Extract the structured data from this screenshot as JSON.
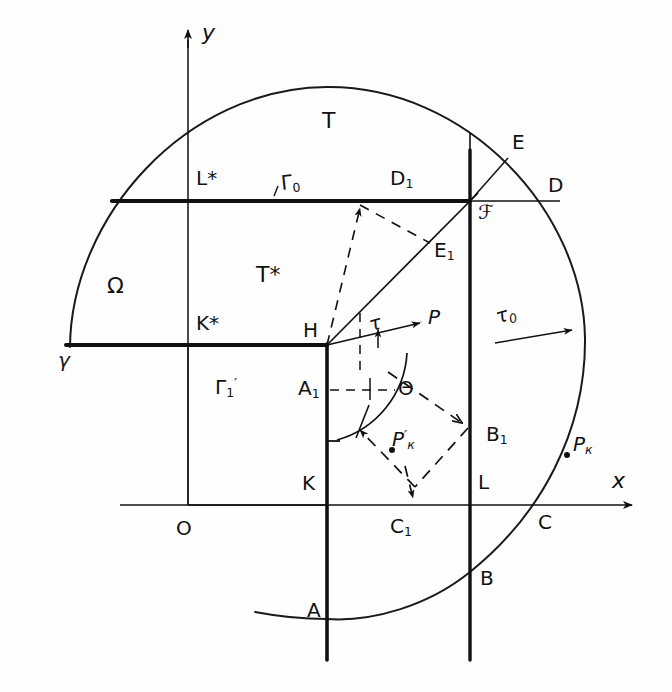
{
  "figure": {
    "type": "hand-drawn-geometric-diagram",
    "background_color": "#fefefe",
    "ink_color": "#111111"
  },
  "axes": {
    "x_axis_label": "x",
    "y_axis_label": "y",
    "origin_label": "O"
  },
  "regions": {
    "outer_domain": "T",
    "inner_domain": "T*",
    "omega": "Ω"
  },
  "boundaries": {
    "gamma": "γ",
    "gamma_zero": "Γ",
    "gamma_zero_sub": "0",
    "gamma_one_prime": "Γ",
    "gamma_one_prime_sub": "1",
    "gamma_one_prime_mark": "′",
    "tau": "τ",
    "tau_zero": "τ",
    "tau_zero_sub": "0"
  },
  "points": {
    "A": "A",
    "B": "B",
    "C": "C",
    "D": "D",
    "E": "E",
    "F": "ℱ",
    "H": "H",
    "K": "K",
    "L": "L",
    "P": "P",
    "K_star": "K*",
    "L_star": "L*",
    "A1": {
      "letter": "A",
      "sub": "1"
    },
    "B1": {
      "letter": "B",
      "sub": "1"
    },
    "C1": {
      "letter": "C",
      "sub": "1"
    },
    "D1": {
      "letter": "D",
      "sub": "1"
    },
    "E1": {
      "letter": "E",
      "sub": "1"
    },
    "Pk": {
      "letter": "P",
      "sub": "к"
    },
    "Pk_prime": {
      "letter": "P",
      "sub": "к",
      "prime": "′"
    }
  },
  "angles": {
    "theta": "Θ"
  },
  "geometry": {
    "circle_center_x": 327,
    "circle_center_y": 343,
    "circle_radius": 257,
    "origin_x": 188,
    "origin_y": 505,
    "vertex_H_x": 327,
    "vertex_H_y": 344,
    "vertex_F_x": 470,
    "vertex_F_y": 201,
    "gamma0_y": 201,
    "k_star_line_y": 345,
    "left_edge_x": 70,
    "x_axis_y": 505
  }
}
